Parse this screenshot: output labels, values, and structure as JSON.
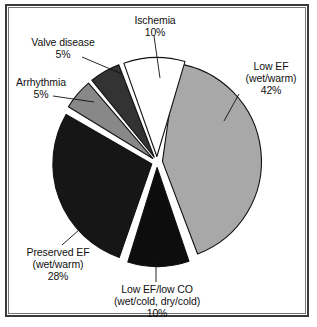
{
  "figure": {
    "background": "#ffffff",
    "frame_color": "#3a3a3a"
  },
  "chart_data": {
    "type": "pie",
    "title": "",
    "subtitle": "",
    "xlabel": "",
    "ylabel": "",
    "legend_position": "none",
    "grid": false,
    "exploded": true,
    "total": 100,
    "units": "%",
    "categories": [
      "Low EF (wet/warm)",
      "Low EF/low CO (wet/cold, dry/cold)",
      "Preserved EF (wet/warm)",
      "Arrhythmia",
      "Valve disease",
      "Ischemia"
    ],
    "values": [
      42,
      10,
      28,
      5,
      5,
      10
    ],
    "colors": [
      "#a8a8a8",
      "#0d0d0d",
      "#161616",
      "#888888",
      "#333333",
      "#ffffff"
    ],
    "slices": [
      {
        "name": "low-ef-wet-warm",
        "label_lines": [
          "Low EF",
          "(wet/warm)",
          "42%"
        ],
        "value": 42,
        "percent": "42%",
        "color": "#a8a8a8",
        "start_deg": 8,
        "end_deg": 159.2
      },
      {
        "name": "low-ef-low-co",
        "label_lines": [
          "Low EF/low CO",
          "(wet/cold, dry/cold)",
          "10%"
        ],
        "value": 10,
        "percent": "10%",
        "color": "#0d0d0d",
        "start_deg": 161.2,
        "end_deg": 197.2
      },
      {
        "name": "preserved-ef-wet-warm",
        "label_lines": [
          "Preserved EF",
          "(wet/warm)",
          "28%"
        ],
        "value": 28,
        "percent": "28%",
        "color": "#161616",
        "start_deg": 199.2,
        "end_deg": 300
      },
      {
        "name": "arrhythmia",
        "label_lines": [
          "Arrhythmia",
          "5%"
        ],
        "value": 5,
        "percent": "5%",
        "color": "#888888",
        "start_deg": 301.5,
        "end_deg": 319.5
      },
      {
        "name": "valve-disease",
        "label_lines": [
          "Valve disease",
          "5%"
        ],
        "value": 5,
        "percent": "5%",
        "color": "#333333",
        "start_deg": 321,
        "end_deg": 339
      },
      {
        "name": "ischemia",
        "label_lines": [
          "Ischemia",
          "10%"
        ],
        "value": 10,
        "percent": "10%",
        "color": "#ffffff",
        "start_deg": 340.5,
        "end_deg": 376.5
      }
    ]
  },
  "labels": {
    "ischemia": {
      "l1": "Ischemia",
      "l2": "10%"
    },
    "valve_disease": {
      "l1": "Valve disease",
      "l2": "5%"
    },
    "arrhythmia": {
      "l1": "Arrhythmia",
      "l2": "5%"
    },
    "low_ef": {
      "l1": "Low EF",
      "l2": "(wet/warm)",
      "l3": "42%"
    },
    "preserved_ef": {
      "l1": "Preserved EF",
      "l2": "(wet/warm)",
      "l3": "28%"
    },
    "low_ef_low_co": {
      "l1": "Low EF/low CO",
      "l2": "(wet/cold, dry/cold)",
      "l3": "10%"
    }
  }
}
